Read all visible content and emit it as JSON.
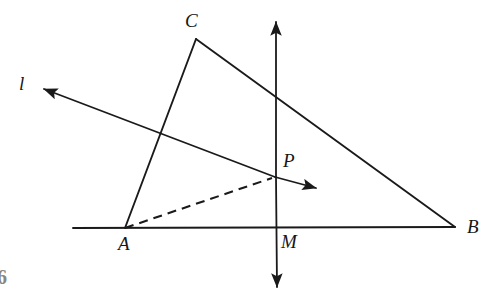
{
  "figure": {
    "background_color": "#ffffff",
    "stroke_color": "#1a1a1a",
    "labels": {
      "vertex_a": "A",
      "vertex_b": "B",
      "vertex_c": "C",
      "point_p": "P",
      "point_m": "M",
      "line_l": "l"
    },
    "page_mark": "6",
    "points": {
      "A": {
        "x": 125,
        "y": 228
      },
      "B": {
        "x": 455,
        "y": 227
      },
      "C": {
        "x": 196,
        "y": 39
      },
      "P": {
        "x": 275,
        "y": 177
      },
      "M": {
        "x": 277,
        "y": 228
      }
    },
    "segments": [
      {
        "name": "baseline-AB",
        "x1": 73,
        "y1": 228,
        "x2": 455,
        "y2": 227,
        "style": "solid"
      },
      {
        "name": "side-AC",
        "x1": 125,
        "y1": 228,
        "x2": 196,
        "y2": 39,
        "style": "solid"
      },
      {
        "name": "side-CB",
        "x1": 196,
        "y1": 39,
        "x2": 455,
        "y2": 227,
        "style": "solid"
      },
      {
        "name": "segment-AP-dashed",
        "x1": 125,
        "y1": 228,
        "x2": 272,
        "y2": 178,
        "style": "dashed"
      }
    ],
    "rays": [
      {
        "name": "line-l-ray-upper-left",
        "x1": 275,
        "y1": 177,
        "x2": 42,
        "y2": 88,
        "arrow": "end"
      },
      {
        "name": "line-l-ray-lower-right",
        "x1": 275,
        "y1": 177,
        "x2": 318,
        "y2": 189,
        "arrow": "end"
      },
      {
        "name": "vertical-line-up",
        "x1": 276,
        "y1": 177,
        "x2": 276,
        "y2": 20,
        "arrow": "end"
      },
      {
        "name": "vertical-line-down",
        "x1": 276,
        "y1": 177,
        "x2": 277,
        "y2": 289,
        "arrow": "end"
      }
    ],
    "label_positions": {
      "vertex_a": {
        "x": 118,
        "y": 234
      },
      "vertex_b": {
        "x": 467,
        "y": 217
      },
      "vertex_c": {
        "x": 185,
        "y": 11
      },
      "point_p": {
        "x": 283,
        "y": 151
      },
      "point_m": {
        "x": 281,
        "y": 232
      },
      "line_l": {
        "x": 19,
        "y": 74
      },
      "page_mark": {
        "x": 0,
        "y": 267
      }
    }
  }
}
